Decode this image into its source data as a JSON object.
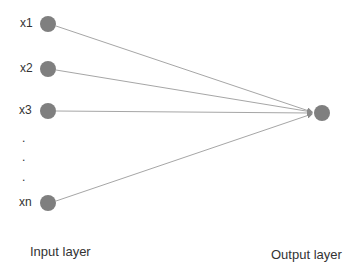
{
  "diagram": {
    "type": "neural-network",
    "input_nodes": [
      {
        "label": "x1",
        "x": 48,
        "y": 24
      },
      {
        "label": "x2",
        "x": 48,
        "y": 69
      },
      {
        "label": "x3",
        "x": 48,
        "y": 111
      },
      {
        "label": "xn",
        "x": 48,
        "y": 203
      }
    ],
    "ellipsis": [
      ".",
      ".",
      "."
    ],
    "output_node": {
      "x": 322,
      "y": 113
    },
    "input_layer_label": "Input layer",
    "output_layer_label": "Output layer",
    "colors": {
      "node": "#7f7f7f",
      "edge": "#a6a6a6",
      "text": "#333333"
    }
  }
}
